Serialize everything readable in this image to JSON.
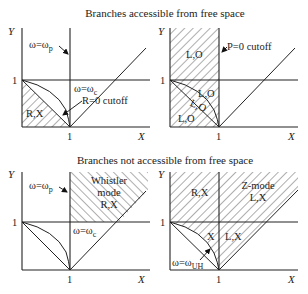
{
  "titles": {
    "top": "Branches accessible from free space",
    "bottom": "Branches not accessible from free space"
  },
  "axes": {
    "x_label": "X",
    "y_label": "Y",
    "tick_one": "1"
  },
  "panels": [
    {
      "id": "top-left",
      "labels": {
        "omega_p": "ω=ω",
        "omega_p_sub": "p",
        "omega_c": "ω=ω",
        "omega_c_sub": "c",
        "cutoff": "R=0 cutoff",
        "region": "R,X"
      }
    },
    {
      "id": "top-right",
      "labels": {
        "cutoff": "P=0 cutoff",
        "region_upper": "L,O",
        "region_mid": "L,O",
        "region_curve": "L,O",
        "region_lower": "L,O"
      }
    },
    {
      "id": "bottom-left",
      "labels": {
        "omega_p": "ω=ω",
        "omega_p_sub": "p",
        "omega_c": "ω=ω",
        "omega_c_sub": "c",
        "whistler_1": "Whistler",
        "whistler_2": "mode",
        "whistler_3": "R,X"
      }
    },
    {
      "id": "bottom-right",
      "labels": {
        "region_rx": "R,X",
        "zmode_1": "Z-mode",
        "zmode_2": "L,X",
        "region_x": "X",
        "region_lx": "L,X",
        "omega_uh": "ω=ω",
        "omega_uh_sub": "UH"
      }
    }
  ]
}
